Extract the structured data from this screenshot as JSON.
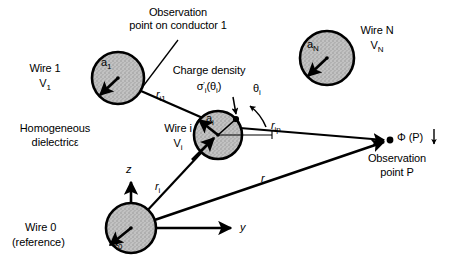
{
  "figure": {
    "type": "technical-diagram",
    "background_color": "#ffffff",
    "ink_color": "#000000",
    "conductor_fill": "#b8b8b8"
  },
  "annotations": {
    "observation_on_conductor_line1": "Observation",
    "observation_on_conductor_line2": "point on conductor 1",
    "charge_density_title": "Charge density",
    "homogeneous_line1": "Homogeneous",
    "homogeneous_line2": "dielectric",
    "dielectric_symbol": "ε",
    "observation_point_line1": "Observation",
    "observation_point_line2": "point P"
  },
  "conductors": [
    {
      "id": "wire-1",
      "name_label": "Wire 1",
      "potential_label": "V",
      "potential_sub": "1",
      "radius_label": "a",
      "radius_sub": "1",
      "cx": 118,
      "cy": 78,
      "r": 26
    },
    {
      "id": "wire-i",
      "name_label": "Wire i",
      "potential_label": "V",
      "potential_sub": "i",
      "radius_label": "a",
      "radius_sub": "i",
      "cx": 218,
      "cy": 135,
      "r": 24
    },
    {
      "id": "wire-n",
      "name_label": "Wire N",
      "potential_label": "V",
      "potential_sub": "N",
      "radius_label": "a",
      "radius_sub": "N",
      "cx": 327,
      "cy": 58,
      "r": 27
    },
    {
      "id": "wire-0",
      "name_label": "Wire 0",
      "reference_label": "(reference)",
      "radius_label": "a",
      "radius_sub": "0",
      "cx": 131,
      "cy": 228,
      "r": 25
    }
  ],
  "charge_density": {
    "symbol": "σ",
    "prime": "'",
    "subscript": "i",
    "argument_open": "(",
    "argument_symbol": "θ",
    "argument_sub": "i",
    "argument_close": ")"
  },
  "angle": {
    "symbol": "θ",
    "subscript": "i"
  },
  "vectors": [
    {
      "id": "r-i1",
      "label": "r",
      "subscript": "i1"
    },
    {
      "id": "r-ip",
      "label": "r",
      "subscript": "ip"
    },
    {
      "id": "r-i",
      "label": "r",
      "subscript": "i"
    },
    {
      "id": "r",
      "label": "r",
      "subscript": ""
    }
  ],
  "axes": [
    {
      "id": "z-axis",
      "label": "z"
    },
    {
      "id": "y-axis",
      "label": "y"
    }
  ],
  "observation_point": {
    "potential_symbol": "Φ",
    "potential_arg": "(P)",
    "x": 390,
    "y": 140
  }
}
